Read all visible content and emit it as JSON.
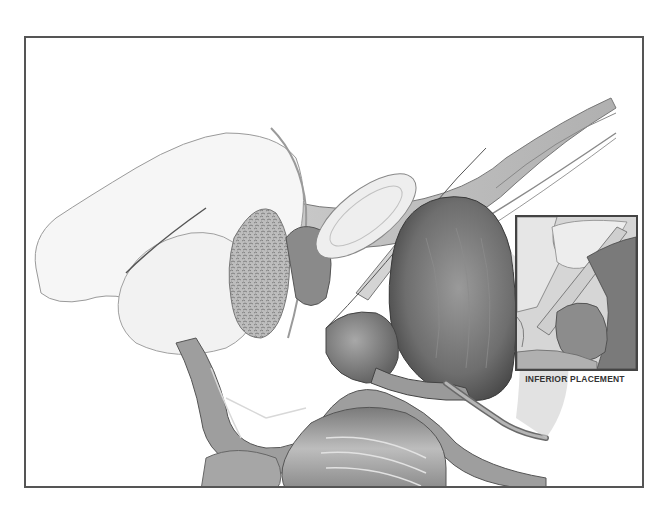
{
  "figure": {
    "type": "medical-illustration",
    "style": "grayscale pencil/airbrush",
    "colors": {
      "background": "#ffffff",
      "frame_border": "#555555",
      "inset_border": "#444444",
      "caption_text": "#333333"
    }
  },
  "inset": {
    "caption": "INFERIOR PLACEMENT"
  }
}
